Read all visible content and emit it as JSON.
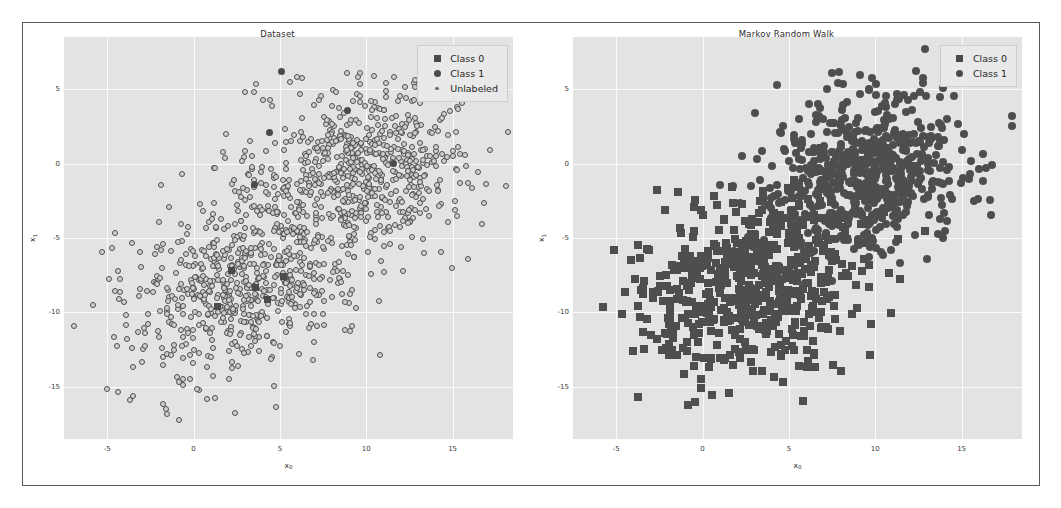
{
  "figure": {
    "background": "#ffffff",
    "border_color": "#5a5a5a",
    "axes_facecolor": "#e3e3e3",
    "grid_color": "#fbfbfb",
    "marker_color": "#4b4b4b"
  },
  "panels": [
    {
      "id": "dataset",
      "title": "Dataset",
      "xlabel": "x",
      "xlabel_sub": "0",
      "ylabel": "x",
      "ylabel_sub": "1",
      "xticks": [
        "-5",
        "0",
        "5",
        "10",
        "15"
      ],
      "yticks": [
        "5",
        "0",
        "-5",
        "-10",
        "-15"
      ],
      "legend": [
        {
          "label": "Class 0",
          "marker": "square-marker-icon"
        },
        {
          "label": "Class 1",
          "marker": "circle-marker-icon"
        },
        {
          "label": "Unlabeled",
          "marker": "small-dot-marker-icon"
        }
      ]
    },
    {
      "id": "markov-random-walk",
      "title": "Markov Random Walk",
      "xlabel": "x",
      "xlabel_sub": "0",
      "ylabel": "x",
      "ylabel_sub": "1",
      "xticks": [
        "-5",
        "0",
        "5",
        "10",
        "15"
      ],
      "yticks": [
        "5",
        "0",
        "-5",
        "-10",
        "-15"
      ],
      "legend": [
        {
          "label": "Class 0",
          "marker": "square-marker-icon"
        },
        {
          "label": "Class 1",
          "marker": "circle-marker-icon"
        }
      ]
    }
  ],
  "chart_data": {
    "type": "scatter",
    "subplots": [
      {
        "title": "Dataset",
        "xlabel": "x0",
        "ylabel": "x1",
        "xlim": [
          -7.5,
          18.5
        ],
        "ylim": [
          -18.5,
          8.5
        ],
        "xticks": [
          -5,
          0,
          5,
          10,
          15
        ],
        "yticks": [
          5,
          0,
          -5,
          -10,
          -15
        ],
        "grid": true,
        "legend_position": "upper right",
        "series": [
          {
            "name": "Class 0",
            "marker": "square",
            "n_points": 5,
            "cluster_center": [
              3.0,
              -8.0
            ],
            "cluster_spread": [
              3.2,
              3.0
            ],
            "points": [
              [
                1.4,
                -9.6
              ],
              [
                3.6,
                -8.3
              ],
              [
                5.2,
                -7.6
              ],
              [
                2.2,
                -7.2
              ],
              [
                4.3,
                -9.1
              ]
            ]
          },
          {
            "name": "Class 1",
            "marker": "circle",
            "n_points": 5,
            "cluster_center": [
              9.5,
              -0.5
            ],
            "cluster_spread": [
              3.0,
              2.8
            ],
            "points": [
              [
                5.1,
                6.2
              ],
              [
                4.4,
                2.1
              ],
              [
                11.6,
                0.0
              ],
              [
                3.5,
                -1.4
              ],
              [
                8.9,
                3.6
              ]
            ]
          },
          {
            "name": "Unlabeled",
            "marker": "small-circle",
            "n_points": 1200,
            "clusters": [
              {
                "center": [
                  3.0,
                  -8.0
                ],
                "spread": [
                  3.2,
                  3.0
                ],
                "n": 600
              },
              {
                "center": [
                  9.5,
                  -0.5
                ],
                "spread": [
                  3.0,
                  2.8
                ],
                "n": 600
              }
            ]
          }
        ]
      },
      {
        "title": "Markov Random Walk",
        "xlabel": "x0",
        "ylabel": "x1",
        "xlim": [
          -7.5,
          18.5
        ],
        "ylim": [
          -18.5,
          8.5
        ],
        "xticks": [
          -5,
          0,
          5,
          10,
          15
        ],
        "yticks": [
          5,
          0,
          -5,
          -10,
          -15
        ],
        "grid": true,
        "legend_position": "upper right",
        "series": [
          {
            "name": "Class 0",
            "marker": "square",
            "n_points": 610,
            "cluster_center": [
              3.0,
              -8.0
            ],
            "cluster_spread": [
              3.2,
              3.0
            ]
          },
          {
            "name": "Class 1",
            "marker": "circle",
            "n_points": 610,
            "cluster_center": [
              9.5,
              -0.5
            ],
            "cluster_spread": [
              3.0,
              2.8
            ]
          }
        ]
      }
    ]
  }
}
